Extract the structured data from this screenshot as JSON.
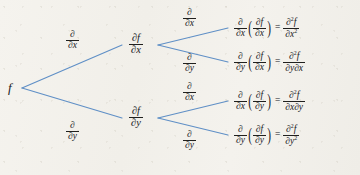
{
  "diagram": {
    "line_color": "#5f8fc6",
    "text_color": "#20201e",
    "background_color": "#f3f1ec",
    "root": {
      "label": "f"
    },
    "level1_edge_labels": [
      {
        "num": "∂",
        "den": "∂x"
      },
      {
        "num": "∂",
        "den": "∂y"
      }
    ],
    "level1_nodes": [
      {
        "num": "∂f",
        "den": "∂x"
      },
      {
        "num": "∂f",
        "den": "∂y"
      }
    ],
    "level2_edge_labels": [
      {
        "num": "∂",
        "den": "∂x"
      },
      {
        "num": "∂",
        "den": "∂y"
      },
      {
        "num": "∂",
        "den": "∂x"
      },
      {
        "num": "∂",
        "den": "∂y"
      }
    ],
    "results": [
      {
        "outer_num": "∂",
        "outer_den": "∂x",
        "inner_num": "∂f",
        "inner_den": "∂x",
        "equals": "=",
        "result_num": "∂",
        "result_num_sup": "2",
        "result_num_var": "f",
        "result_den": "∂x",
        "result_den_sup": "2",
        "result_den_tail": ""
      },
      {
        "outer_num": "∂",
        "outer_den": "∂y",
        "inner_num": "∂f",
        "inner_den": "∂x",
        "equals": "=",
        "result_num": "∂",
        "result_num_sup": "2",
        "result_num_var": "f",
        "result_den": "∂y",
        "result_den_sup": "",
        "result_den_tail": "∂x"
      },
      {
        "outer_num": "∂",
        "outer_den": "∂x",
        "inner_num": "∂f",
        "inner_den": "∂y",
        "equals": "=",
        "result_num": "∂",
        "result_num_sup": "2",
        "result_num_var": "f",
        "result_den": "∂x",
        "result_den_sup": "",
        "result_den_tail": "∂y"
      },
      {
        "outer_num": "∂",
        "outer_den": "∂y",
        "inner_num": "∂f",
        "inner_den": "∂y",
        "equals": "=",
        "result_num": "∂",
        "result_num_sup": "2",
        "result_num_var": "f",
        "result_den": "∂y",
        "result_den_sup": "2",
        "result_den_tail": ""
      }
    ],
    "paren_open": "(",
    "paren_close": ")"
  }
}
